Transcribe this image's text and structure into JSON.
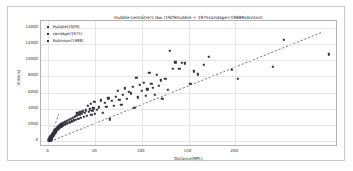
{
  "chart_data": {
    "type": "scatter",
    "title": "Hubble-Lemaître's law (1929Hubble + 1975sandage+1988Robinson)",
    "xlabel": "Distance(MPc)",
    "ylabel": "V(Km/s)",
    "xlim": [
      -8,
      310
    ],
    "ylim": [
      -700,
      14800
    ],
    "xticks": [
      0,
      50,
      100,
      150,
      200
    ],
    "yticks": [
      0,
      2000,
      4000,
      6000,
      8000,
      10000,
      12000,
      14000
    ],
    "grid": true,
    "legend_position": "upper-left",
    "marker_color": "#32323c",
    "trendline_color": "#3c3c46",
    "legend": [
      {
        "label": "Hubble(1929)",
        "color": "#32323c"
      },
      {
        "label": "sandage(1975)",
        "color": "#32323c"
      },
      {
        "label": "Robinson(1988)",
        "color": "#32323c"
      }
    ],
    "trendline": {
      "style": "dashed",
      "x0": 2,
      "y0": -250,
      "x1": 296,
      "y1": 13450
    },
    "steep_line": {
      "style": "dashed",
      "x0": 1.0,
      "y0": -300,
      "x1": 11.0,
      "y1": 3150
    },
    "points": [
      [
        0.5,
        60
      ],
      [
        0.6,
        120
      ],
      [
        0.7,
        20
      ],
      [
        0.8,
        200
      ],
      [
        0.9,
        90
      ],
      [
        1.0,
        150
      ],
      [
        1.1,
        260
      ],
      [
        1.2,
        40
      ],
      [
        1.3,
        310
      ],
      [
        1.4,
        180
      ],
      [
        1.5,
        350
      ],
      [
        1.6,
        100
      ],
      [
        1.7,
        420
      ],
      [
        1.8,
        240
      ],
      [
        1.9,
        130
      ],
      [
        2.0,
        480
      ],
      [
        2.1,
        330
      ],
      [
        2.2,
        70
      ],
      [
        2.3,
        540
      ],
      [
        2.4,
        410
      ],
      [
        2.5,
        180
      ],
      [
        2.6,
        600
      ],
      [
        2.7,
        290
      ],
      [
        2.8,
        470
      ],
      [
        2.9,
        360
      ],
      [
        3.0,
        650
      ],
      [
        3.1,
        520
      ],
      [
        3.2,
        230
      ],
      [
        3.3,
        700
      ],
      [
        3.4,
        430
      ],
      [
        3.5,
        580
      ],
      [
        3.6,
        310
      ],
      [
        3.7,
        760
      ],
      [
        3.8,
        640
      ],
      [
        3.9,
        490
      ],
      [
        4.0,
        820
      ],
      [
        4.2,
        560
      ],
      [
        4.4,
        700
      ],
      [
        4.6,
        900
      ],
      [
        4.8,
        640
      ],
      [
        5.0,
        980
      ],
      [
        5.2,
        760
      ],
      [
        5.4,
        1090
      ],
      [
        5.6,
        850
      ],
      [
        5.8,
        690
      ],
      [
        6.0,
        1160
      ],
      [
        6.3,
        930
      ],
      [
        6.6,
        1250
      ],
      [
        6.9,
        1020
      ],
      [
        7.2,
        1340
      ],
      [
        7.5,
        1120
      ],
      [
        7.8,
        1430
      ],
      [
        8.1,
        1210
      ],
      [
        8.4,
        1510
      ],
      [
        8.7,
        1320
      ],
      [
        9.0,
        1610
      ],
      [
        9.4,
        1400
      ],
      [
        9.8,
        1700
      ],
      [
        10.2,
        1490
      ],
      [
        10.6,
        1800
      ],
      [
        11.0,
        1580
      ],
      [
        11.5,
        1890
      ],
      [
        12.0,
        1670
      ],
      [
        12.5,
        1980
      ],
      [
        13.0,
        1760
      ],
      [
        13.5,
        2080
      ],
      [
        14.0,
        1850
      ],
      [
        14.5,
        2180
      ],
      [
        15.0,
        1950
      ],
      [
        16.0,
        2280
      ],
      [
        17.0,
        2050
      ],
      [
        18.0,
        2400
      ],
      [
        19.0,
        2150
      ],
      [
        20.0,
        2520
      ],
      [
        21.0,
        2250
      ],
      [
        22.0,
        2640
      ],
      [
        23.0,
        2350
      ],
      [
        24.0,
        2760
      ],
      [
        25.0,
        2450
      ],
      [
        26.0,
        2880
      ],
      [
        27.0,
        2560
      ],
      [
        28.0,
        3000
      ],
      [
        29.0,
        2660
      ],
      [
        30.0,
        3120
      ],
      [
        31.0,
        3450
      ],
      [
        32.0,
        2780
      ],
      [
        33.0,
        3240
      ],
      [
        34.0,
        3560
      ],
      [
        35.0,
        2900
      ],
      [
        36.0,
        3360
      ],
      [
        37.0,
        3680
      ],
      [
        38.0,
        3020
      ],
      [
        39.0,
        3480
      ],
      [
        40.0,
        3800
      ],
      [
        41.0,
        3140
      ],
      [
        42.0,
        4400
      ],
      [
        43.0,
        3600
      ],
      [
        44.0,
        3920
      ],
      [
        45.0,
        4600
      ],
      [
        46.0,
        3260
      ],
      [
        47.0,
        3720
      ],
      [
        48.0,
        4040
      ],
      [
        49.0,
        4820
      ],
      [
        50.0,
        3380
      ],
      [
        52.0,
        3840
      ],
      [
        54.0,
        4160
      ],
      [
        56.0,
        5050
      ],
      [
        58.0,
        3500
      ],
      [
        60.0,
        4700
      ],
      [
        62.0,
        4280
      ],
      [
        64.0,
        5280
      ],
      [
        66.0,
        2700
      ],
      [
        68.0,
        4950
      ],
      [
        70.0,
        4400
      ],
      [
        72.0,
        5500
      ],
      [
        74.0,
        6250
      ],
      [
        76.0,
        5100
      ],
      [
        78.0,
        4520
      ],
      [
        80.0,
        5720
      ],
      [
        82.0,
        6500
      ],
      [
        84.0,
        5250
      ],
      [
        86.0,
        6050
      ],
      [
        88.0,
        5900
      ],
      [
        90.0,
        6700
      ],
      [
        92.0,
        4100
      ],
      [
        94.0,
        7800
      ],
      [
        96.0,
        5400
      ],
      [
        98.0,
        6950
      ],
      [
        100.0,
        6200
      ],
      [
        102.0,
        7200
      ],
      [
        104.0,
        5550
      ],
      [
        106.0,
        6400
      ],
      [
        108.0,
        8400
      ],
      [
        110.0,
        7100
      ],
      [
        112.0,
        6600
      ],
      [
        114.0,
        5700
      ],
      [
        116.0,
        8150
      ],
      [
        118.0,
        6850
      ],
      [
        120.0,
        7500
      ],
      [
        122.0,
        5200
      ],
      [
        125.0,
        7700
      ],
      [
        128.0,
        6350
      ],
      [
        130.0,
        11150
      ],
      [
        133.0,
        8900
      ],
      [
        136.0,
        9700
      ],
      [
        140.0,
        8950
      ],
      [
        143.0,
        9650
      ],
      [
        146.0,
        9600
      ],
      [
        152.0,
        7100
      ],
      [
        156.0,
        8600
      ],
      [
        160.0,
        8250
      ],
      [
        166.0,
        9400
      ],
      [
        172.0,
        10400
      ],
      [
        196.0,
        8800
      ],
      [
        203.0,
        7700
      ],
      [
        240.0,
        9200
      ],
      [
        252.0,
        12450
      ],
      [
        300.0,
        10700
      ]
    ]
  }
}
